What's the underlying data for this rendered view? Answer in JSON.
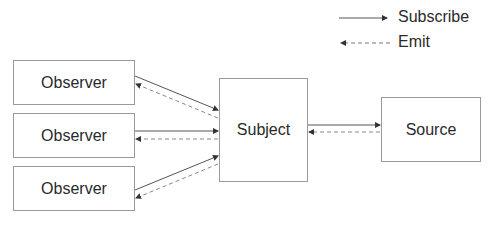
{
  "legend": {
    "items": [
      {
        "label": "Subscribe",
        "style": "solid"
      },
      {
        "label": "Emit",
        "style": "dashed"
      }
    ]
  },
  "nodes": {
    "observers": [
      {
        "label": "Observer"
      },
      {
        "label": "Observer"
      },
      {
        "label": "Observer"
      }
    ],
    "subject": {
      "label": "Subject"
    },
    "source": {
      "label": "Source"
    }
  },
  "colors": {
    "line": "#555555",
    "border": "#9a9a9a",
    "text": "#2a2a2a"
  }
}
